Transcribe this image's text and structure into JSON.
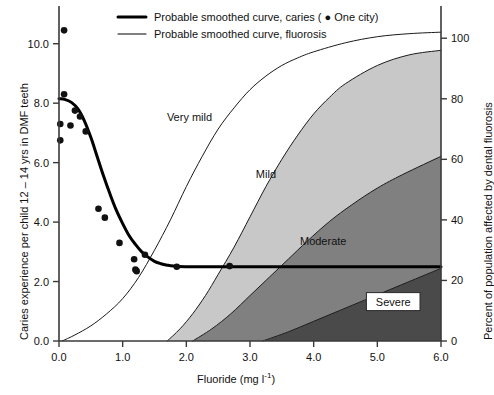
{
  "chart_data": {
    "type": "area",
    "title": "",
    "xlabel": "Fluoride (mg l-1)",
    "xlabel_main": "Fluoride (mg l",
    "xlabel_sup": "-1",
    "xlabel_tail": ")",
    "ylabel": "Caries experience per child 12 – 14 yrs in DMF teeth",
    "ylabel_right": "Percent of population affected by dental fluorosis",
    "xlim": [
      0.0,
      6.0
    ],
    "ylim_left": [
      0.0,
      11.0
    ],
    "ylim_right": [
      0,
      108
    ],
    "grid": false,
    "legend_position": "top-center",
    "xticks": [
      "0.0",
      "1.0",
      "2.0",
      "3.0",
      "4.0",
      "5.0",
      "6.0"
    ],
    "xtick_values": [
      0.0,
      1.0,
      2.0,
      3.0,
      4.0,
      5.0,
      6.0
    ],
    "yticks_left": [
      "0.0",
      "2.0",
      "4.0",
      "6.0",
      "8.0",
      "10.0"
    ],
    "ytick_values_left": [
      0.0,
      2.0,
      4.0,
      6.0,
      8.0,
      10.0
    ],
    "yticks_right": [
      "0",
      "20",
      "40",
      "60",
      "80",
      "100"
    ],
    "ytick_values_right": [
      0,
      20,
      40,
      60,
      80,
      100
    ],
    "legend": [
      {
        "label": "Probable smoothed curve, caries ( ● One city)",
        "style": "thick-line",
        "color": "#000000"
      },
      {
        "label": "Probable smoothed curve, fluorosis",
        "style": "thin-line",
        "color": "#000000"
      }
    ],
    "annotations": [
      {
        "text": "Very mild",
        "x": 2.05,
        "y_percent": 74,
        "boxed": false
      },
      {
        "text": "Mild",
        "x": 3.25,
        "y_percent": 55,
        "boxed": false
      },
      {
        "text": "Moderate",
        "x": 4.15,
        "y_percent": 33,
        "boxed": false
      },
      {
        "text": "Severe",
        "x": 5.25,
        "y_percent": 13,
        "boxed": true
      }
    ],
    "colors": {
      "very_mild_band": "#ffffff",
      "mild_band": "#c8c8c8",
      "moderate_band": "#808080",
      "severe_band": "#4a4a4a",
      "curve": "#000000",
      "axis": "#3a3a3a"
    },
    "series": [
      {
        "name": "Probable smoothed curve, caries",
        "type": "line",
        "axis": "left",
        "linewidth": 3,
        "points": [
          [
            0.0,
            8.15
          ],
          [
            0.1,
            8.12
          ],
          [
            0.2,
            8.02
          ],
          [
            0.3,
            7.8
          ],
          [
            0.4,
            7.4
          ],
          [
            0.5,
            6.85
          ],
          [
            0.6,
            6.2
          ],
          [
            0.7,
            5.55
          ],
          [
            0.8,
            4.95
          ],
          [
            0.9,
            4.4
          ],
          [
            1.0,
            3.95
          ],
          [
            1.1,
            3.55
          ],
          [
            1.2,
            3.25
          ],
          [
            1.3,
            3.0
          ],
          [
            1.4,
            2.82
          ],
          [
            1.5,
            2.68
          ],
          [
            1.6,
            2.6
          ],
          [
            1.7,
            2.55
          ],
          [
            1.8,
            2.52
          ],
          [
            2.0,
            2.5
          ],
          [
            3.0,
            2.5
          ],
          [
            4.0,
            2.5
          ],
          [
            5.0,
            2.5
          ],
          [
            6.0,
            2.5
          ]
        ]
      },
      {
        "name": "Probable smoothed curve, fluorosis",
        "type": "line",
        "axis": "right",
        "linewidth": 1,
        "points": [
          [
            0.05,
            0.0
          ],
          [
            0.25,
            2.0
          ],
          [
            0.5,
            5.0
          ],
          [
            0.75,
            9.0
          ],
          [
            1.0,
            14.0
          ],
          [
            1.25,
            21.0
          ],
          [
            1.5,
            30.0
          ],
          [
            1.75,
            40.0
          ],
          [
            2.0,
            51.0
          ],
          [
            2.25,
            61.0
          ],
          [
            2.5,
            70.0
          ],
          [
            2.75,
            77.0
          ],
          [
            3.0,
            83.0
          ],
          [
            3.25,
            87.5
          ],
          [
            3.5,
            91.0
          ],
          [
            3.75,
            93.5
          ],
          [
            4.0,
            95.5
          ],
          [
            4.5,
            98.5
          ],
          [
            5.0,
            100.5
          ],
          [
            5.5,
            101.5
          ],
          [
            6.0,
            102.0
          ]
        ]
      },
      {
        "name": "Mild band upper boundary",
        "type": "boundary",
        "axis": "right",
        "points": [
          [
            1.7,
            0.0
          ],
          [
            1.9,
            4.0
          ],
          [
            2.1,
            9.0
          ],
          [
            2.3,
            15.0
          ],
          [
            2.5,
            22.0
          ],
          [
            2.75,
            31.0
          ],
          [
            3.0,
            41.0
          ],
          [
            3.25,
            51.0
          ],
          [
            3.5,
            60.0
          ],
          [
            3.75,
            68.0
          ],
          [
            4.0,
            75.0
          ],
          [
            4.25,
            80.5
          ],
          [
            4.5,
            85.0
          ],
          [
            5.0,
            91.0
          ],
          [
            5.5,
            94.5
          ],
          [
            6.0,
            96.0
          ]
        ]
      },
      {
        "name": "Moderate band upper boundary",
        "type": "boundary",
        "axis": "right",
        "points": [
          [
            2.1,
            0.0
          ],
          [
            2.4,
            4.0
          ],
          [
            2.7,
            9.0
          ],
          [
            3.0,
            15.0
          ],
          [
            3.3,
            21.0
          ],
          [
            3.6,
            27.0
          ],
          [
            3.9,
            33.0
          ],
          [
            4.25,
            39.5
          ],
          [
            4.6,
            45.0
          ],
          [
            5.0,
            50.5
          ],
          [
            5.4,
            55.0
          ],
          [
            6.0,
            61.0
          ]
        ]
      },
      {
        "name": "Severe band upper boundary",
        "type": "boundary",
        "axis": "right",
        "points": [
          [
            3.2,
            0.0
          ],
          [
            3.6,
            3.0
          ],
          [
            4.0,
            6.5
          ],
          [
            4.4,
            10.0
          ],
          [
            4.8,
            13.5
          ],
          [
            5.2,
            17.0
          ],
          [
            5.6,
            20.5
          ],
          [
            6.0,
            24.0
          ]
        ]
      }
    ],
    "scatter": {
      "name": "One city",
      "axis": "left",
      "marker": "filled-circle",
      "points": [
        [
          0.08,
          10.45
        ],
        [
          0.08,
          8.3
        ],
        [
          0.02,
          7.3
        ],
        [
          0.25,
          7.75
        ],
        [
          0.33,
          7.55
        ],
        [
          0.18,
          7.25
        ],
        [
          0.02,
          6.75
        ],
        [
          0.42,
          7.05
        ],
        [
          0.62,
          4.45
        ],
        [
          0.72,
          4.15
        ],
        [
          0.95,
          3.3
        ],
        [
          1.18,
          2.75
        ],
        [
          1.2,
          2.4
        ],
        [
          1.22,
          2.35
        ],
        [
          1.35,
          2.9
        ],
        [
          1.85,
          2.5
        ],
        [
          2.68,
          2.52
        ]
      ]
    }
  }
}
